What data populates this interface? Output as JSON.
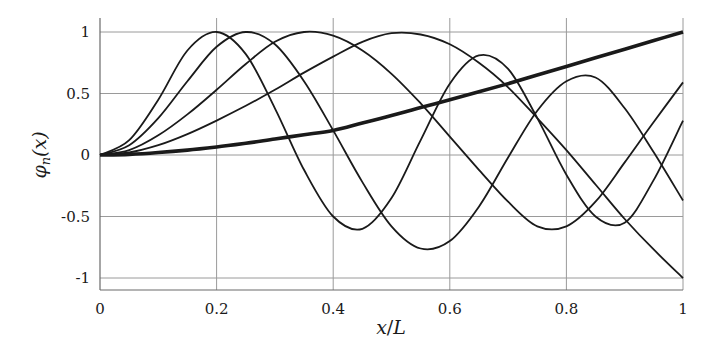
{
  "chart_data": {
    "type": "line",
    "title": "",
    "xlabel": "x/L",
    "ylabel": "φn(x)",
    "xlim": [
      0,
      1
    ],
    "ylim": [
      -1.1,
      1.1
    ],
    "grid": true,
    "legend": null,
    "x_ticks": [
      0,
      0.2,
      0.4,
      0.6,
      0.8,
      1
    ],
    "x_tick_labels": [
      "0",
      "0.2",
      "0.4",
      "0.6",
      "0.8",
      "1"
    ],
    "y_ticks": [
      1,
      0.5,
      0,
      -0.5,
      -1
    ],
    "y_tick_labels": [
      "1",
      "0.5",
      "0",
      "-0.5",
      "-1"
    ],
    "x": [
      0,
      0.05,
      0.1,
      0.15,
      0.2,
      0.25,
      0.3,
      0.35,
      0.4,
      0.45,
      0.5,
      0.55,
      0.6,
      0.65,
      0.7,
      0.75,
      0.8,
      0.85,
      0.9,
      0.95,
      1
    ],
    "series": [
      {
        "name": "mode 1",
        "thick": true,
        "values": [
          0,
          0.005,
          0.02,
          0.04,
          0.065,
          0.095,
          0.13,
          0.165,
          0.2,
          0.26,
          0.32,
          0.385,
          0.45,
          0.515,
          0.58,
          0.65,
          0.72,
          0.79,
          0.86,
          0.93,
          1
        ]
      },
      {
        "name": "mode 2",
        "thick": false,
        "values": [
          0,
          0.02,
          0.08,
          0.17,
          0.28,
          0.4,
          0.53,
          0.67,
          0.8,
          0.92,
          0.99,
          0.98,
          0.9,
          0.75,
          0.55,
          0.3,
          0.04,
          -0.24,
          -0.52,
          -0.77,
          -1
        ]
      },
      {
        "name": "mode 3",
        "thick": false,
        "values": [
          0,
          0.04,
          0.16,
          0.33,
          0.53,
          0.74,
          0.92,
          1,
          0.97,
          0.85,
          0.66,
          0.42,
          0.15,
          -0.12,
          -0.38,
          -0.58,
          -0.58,
          -0.38,
          -0.06,
          0.27,
          0.59
        ]
      },
      {
        "name": "mode 4",
        "thick": false,
        "values": [
          0,
          0.08,
          0.3,
          0.6,
          0.88,
          1,
          0.9,
          0.6,
          0.2,
          -0.22,
          -0.58,
          -0.76,
          -0.7,
          -0.42,
          -0.02,
          0.36,
          0.6,
          0.63,
          0.38,
          0.02,
          -0.37
        ]
      },
      {
        "name": "mode 5",
        "thick": false,
        "values": [
          0,
          0.12,
          0.45,
          0.85,
          1,
          0.82,
          0.38,
          -0.12,
          -0.5,
          -0.6,
          -0.35,
          0.12,
          0.58,
          0.81,
          0.7,
          0.3,
          -0.16,
          -0.5,
          -0.55,
          -0.2,
          0.28
        ]
      }
    ]
  },
  "plot": {
    "x_axis_label_main": "x",
    "x_axis_label_sep": "/",
    "x_axis_label_den": "L",
    "y_axis_label_main": "φ",
    "y_axis_label_sub": "n",
    "y_axis_label_arg": "(x)"
  }
}
